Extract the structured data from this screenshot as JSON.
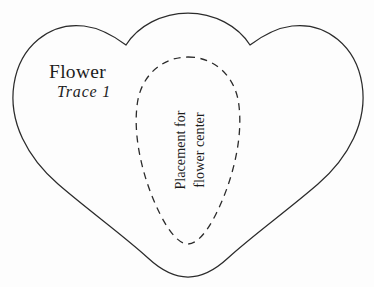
{
  "document": {
    "title": "Flower",
    "subtitle": "Trace 1",
    "background_color": "#fdfdfd",
    "ink_color": "#2b2b2b",
    "text_color": "#1d1d1d"
  },
  "labels": {
    "title": "Flower",
    "subtitle": "Trace 1"
  },
  "placement_guide": {
    "line_1": "Placement for",
    "line_2": "flower center",
    "stroke_style": "dashed"
  },
  "shapes": {
    "outline_name": "flower-outline",
    "guide_name": "flower-center-placement-guide"
  }
}
